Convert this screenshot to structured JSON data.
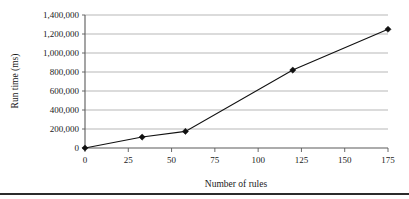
{
  "chart_data": {
    "type": "line",
    "title": "",
    "xlabel": "Number of rules",
    "ylabel": "Run time (ms)",
    "x": [
      0,
      33,
      58,
      120,
      175
    ],
    "values": [
      0,
      115000,
      175000,
      820000,
      1250000
    ],
    "series": [
      {
        "name": "Run time",
        "x": [
          0,
          33,
          58,
          120,
          175
        ],
        "values": [
          0,
          115000,
          175000,
          820000,
          1250000
        ],
        "marker": "diamond",
        "color": "#111111"
      }
    ],
    "xlim": [
      0,
      175
    ],
    "ylim": [
      0,
      1400000
    ],
    "xticks": [
      0,
      25,
      50,
      75,
      100,
      125,
      150,
      175
    ],
    "xtick_labels": [
      "0",
      "25",
      "50",
      "75",
      "100",
      "125",
      "150",
      "175"
    ],
    "yticks": [
      0,
      200000,
      400000,
      600000,
      800000,
      1000000,
      1200000,
      1400000
    ],
    "ytick_labels": [
      "0",
      "200,000",
      "400,000",
      "600,000",
      "800,000",
      "1,000,000",
      "1,200,000",
      "1,400,000"
    ],
    "grid": {
      "horizontal": true,
      "vertical": false,
      "color": "#9a9a9a"
    },
    "legend": {
      "visible": false,
      "position": "none"
    },
    "axis_color": "#5a5a5a",
    "background": "#ffffff"
  },
  "figure": {
    "footer_rule_color": "#2b2b2b"
  }
}
